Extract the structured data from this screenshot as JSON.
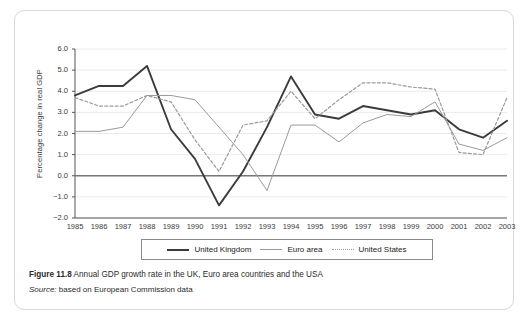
{
  "figure": {
    "caption_prefix": "Figure 11.8",
    "caption_text": "Annual GDP growth rate in the UK, Euro area countries and the USA",
    "source_prefix": "Source:",
    "source_text": "based on European Commission data"
  },
  "legend": {
    "items": [
      {
        "label": "United Kingdom",
        "style": "solid-thick",
        "color": "#3b3b3b"
      },
      {
        "label": "Euro area",
        "style": "solid-thin",
        "color": "#9a9a9a"
      },
      {
        "label": "United States",
        "style": "dotted",
        "color": "#9a9a9a"
      }
    ]
  },
  "chart_data": {
    "type": "line",
    "title": "Annual GDP growth rate in the UK, Euro area countries and the USA",
    "xlabel": "",
    "ylabel": "Percentage change in real GDP",
    "x": [
      1985,
      1986,
      1987,
      1988,
      1989,
      1990,
      1991,
      1992,
      1993,
      1994,
      1995,
      1996,
      1997,
      1998,
      1999,
      2000,
      2001,
      2002,
      2003
    ],
    "categories": [
      "1985",
      "1986",
      "1987",
      "1988",
      "1989",
      "1990",
      "1991",
      "1992",
      "1993",
      "1994",
      "1995",
      "1996",
      "1997",
      "1998",
      "1999",
      "2000",
      "2001",
      "2002",
      "2003"
    ],
    "ylim": [
      -2.0,
      6.0
    ],
    "yticks": [
      -2.0,
      -1.0,
      0.0,
      1.0,
      2.0,
      3.0,
      4.0,
      5.0,
      6.0
    ],
    "ytick_labels": [
      "−2.0",
      "−1.0",
      "0.0",
      "1.0",
      "2.0",
      "3.0",
      "4.0",
      "5.0",
      "6.0"
    ],
    "grid": true,
    "legend_position": "below",
    "zero_line": 0.0,
    "series": [
      {
        "name": "United Kingdom",
        "color": "#3b3b3b",
        "style": "solid-thick",
        "values": [
          3.8,
          4.25,
          4.25,
          5.2,
          2.2,
          0.8,
          -1.4,
          0.2,
          2.3,
          4.7,
          2.9,
          2.7,
          3.3,
          3.1,
          2.9,
          3.1,
          2.2,
          1.8,
          2.6
        ]
      },
      {
        "name": "Euro area",
        "color": "#9a9a9a",
        "style": "solid-thin",
        "values": [
          2.1,
          2.1,
          2.3,
          3.8,
          3.8,
          3.6,
          2.3,
          1.0,
          -0.7,
          2.4,
          2.4,
          1.6,
          2.5,
          2.9,
          2.8,
          3.5,
          1.5,
          1.2,
          1.8
        ]
      },
      {
        "name": "United States",
        "color": "#9a9a9a",
        "style": "dotted",
        "values": [
          3.7,
          3.3,
          3.3,
          3.8,
          3.5,
          1.7,
          0.2,
          2.4,
          2.6,
          4.0,
          2.7,
          3.6,
          4.4,
          4.4,
          4.2,
          4.1,
          1.1,
          1.0,
          3.7
        ]
      }
    ]
  }
}
